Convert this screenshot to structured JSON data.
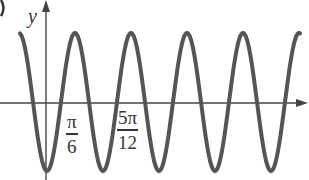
{
  "chart_data": {
    "type": "line",
    "title": "",
    "xlabel": "",
    "ylabel": "y",
    "function_shape": "sinusoid, minimum at origin (y = -A cos(kx) form)",
    "x_tick_labels": [
      {
        "num": "π",
        "den": "6"
      },
      {
        "num": "5π",
        "den": "12"
      }
    ],
    "peaks_px_x": [
      75,
      131,
      187,
      243
    ],
    "troughs_px_x": [
      47,
      103,
      159,
      215,
      271
    ],
    "period_px": 56,
    "grid": false,
    "legend": null,
    "colors": {
      "curve": "#555555",
      "axes": "#444444",
      "text": "#333333"
    }
  },
  "labels": {
    "y_axis": "y",
    "tick1_num": "π",
    "tick1_den": "6",
    "tick2_num": "5π",
    "tick2_den": "12",
    "corner_fragment": ")"
  }
}
